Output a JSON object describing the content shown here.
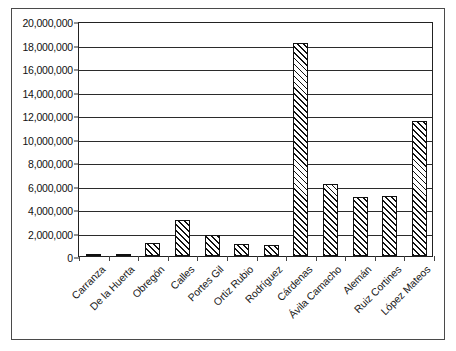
{
  "chart_data": {
    "type": "bar",
    "title": "",
    "subtitle": "",
    "xlabel": "",
    "ylabel": "",
    "ylim": [
      0,
      20000000
    ],
    "ytick_step": 2000000,
    "grid": true,
    "legend": false,
    "legend_position": "none",
    "bar_fill": "diagonal-hatch",
    "categories": [
      "Carranza",
      "De la Huerta",
      "Obregón",
      "Calles",
      "Portes Gil",
      "Ortiz Rubio",
      "Rodríguez",
      "Cárdenas",
      "Ávila Camacho",
      "Alemán",
      "Ruiz Cortines",
      "López Mateos"
    ],
    "values": [
      160000,
      20000,
      1150000,
      3050000,
      1750000,
      1050000,
      900000,
      18100000,
      6100000,
      5000000,
      5100000,
      11500000
    ],
    "ytick_labels": [
      "20,000,000",
      "18,000,000",
      "16,000,000",
      "14,000,000",
      "12,000,000",
      "10,000,000",
      "8,000,000",
      "6,000,000",
      "4,000,000",
      "2,000,000",
      "0"
    ],
    "ytick_values": [
      20000000,
      18000000,
      16000000,
      14000000,
      12000000,
      10000000,
      8000000,
      6000000,
      4000000,
      2000000,
      0
    ],
    "colors": {
      "bar_outline": "#101010",
      "bar_hatch": "#111111",
      "bar_background": "#ffffff",
      "gridline": "#2b2b2b",
      "axis": "#222222",
      "frame": "#4a4a4a",
      "text": "#111111",
      "plot_background": "#ffffff"
    }
  }
}
